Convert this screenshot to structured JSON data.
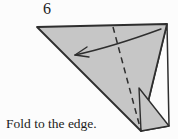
{
  "step": {
    "number": "6"
  },
  "caption": {
    "text": "Fold to the edge."
  },
  "colors": {
    "paper_gray": "#c6c6c6",
    "paper_white": "#fcfcfc",
    "line": "#2e2e2e",
    "text": "#1c1c1c"
  },
  "diagram": {
    "big_triangle_points": "37,27 167,24 141,131",
    "right_flap_points": "167,24 169,126 141,131",
    "corner_triangle_points": "139,88 169,126 141,131",
    "fold_line_points": "113,27 141,131",
    "arrow_path": "M 161 29 Q 112 47 75 55",
    "arrow_head_points": "87,47 75,55 89,57"
  }
}
